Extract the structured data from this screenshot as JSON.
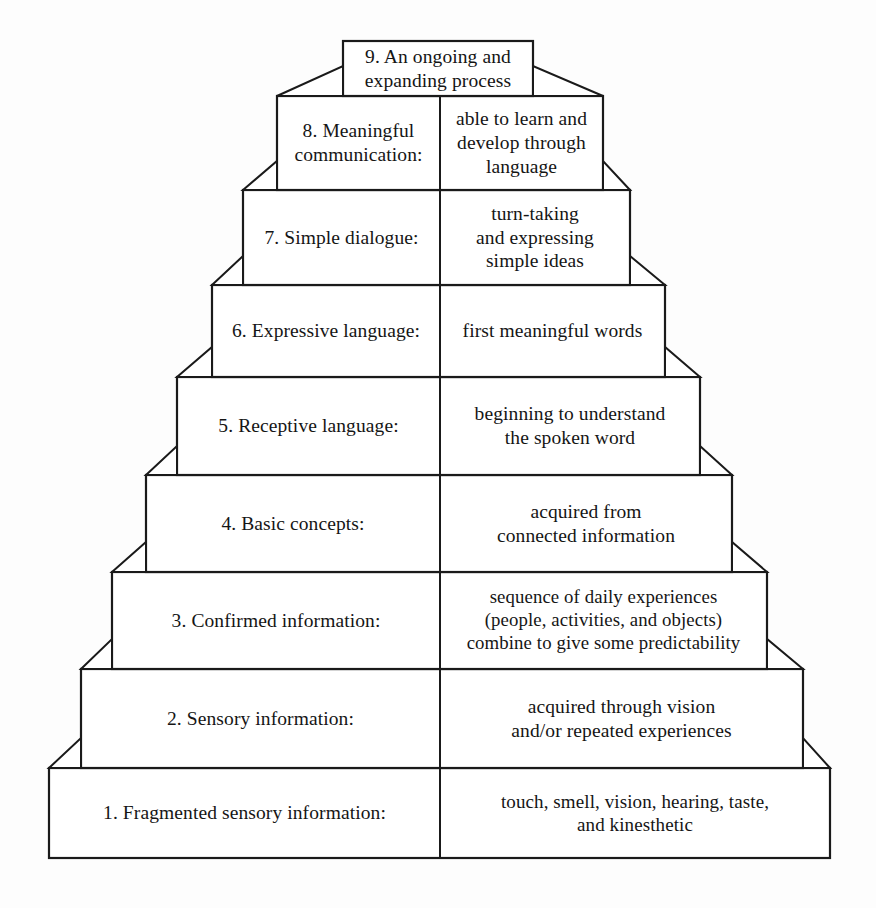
{
  "diagram": {
    "type": "stepped-pyramid",
    "orientation": "bottom-up",
    "level_count": 9,
    "colors": {
      "background": "#fdfdfd",
      "box_fill": "#ffffff",
      "line": "#1a1a1a",
      "text": "#151515"
    },
    "levels": [
      {
        "number": "1",
        "label": "1. Fragmented sensory information:",
        "description_lines": [
          "touch, smell, vision, hearing, taste,",
          "and  kinesthetic"
        ]
      },
      {
        "number": "2",
        "label": "2. Sensory information:",
        "description_lines": [
          "acquired through vision",
          "and/or repeated experiences"
        ]
      },
      {
        "number": "3",
        "label": "3. Confirmed information:",
        "description_lines": [
          "sequence of daily experiences",
          "(people, activities, and objects)",
          "combine to give some predictability"
        ]
      },
      {
        "number": "4",
        "label": "4. Basic concepts:",
        "description_lines": [
          "acquired from",
          "connected information"
        ]
      },
      {
        "number": "5",
        "label": "5. Receptive language:",
        "description_lines": [
          "beginning to understand",
          "the spoken word"
        ]
      },
      {
        "number": "6",
        "label": "6. Expressive language:",
        "description_lines": [
          "first meaningful words"
        ]
      },
      {
        "number": "7",
        "label": "7. Simple dialogue:",
        "description_lines": [
          "turn-taking",
          "and expressing",
          "simple ideas"
        ]
      },
      {
        "number": "8",
        "label": "8. Meaningful communication:",
        "label_lines": [
          "8. Meaningful",
          "communication:"
        ],
        "description_lines": [
          "able to learn and",
          "develop through",
          "language"
        ]
      },
      {
        "number": "9",
        "label": "9. An ongoing and expanding process",
        "label_lines": [
          "9.  An ongoing and",
          "expanding process"
        ],
        "description_lines": []
      }
    ]
  }
}
